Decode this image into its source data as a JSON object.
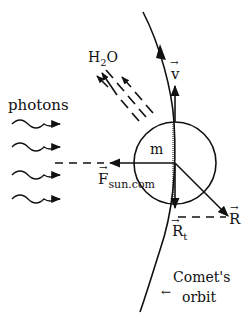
{
  "diagram": {
    "labels": {
      "photons": "photons",
      "water": "H",
      "water_sub": "2",
      "water_tail": "O",
      "velocity": "v",
      "mass": "m",
      "force": "F",
      "force_sub": "sun.com",
      "reaction_total": "R",
      "reaction_tangential": "R",
      "reaction_tangential_sub": "t",
      "orbit_line1": "Comet's",
      "orbit_line2": "orbit",
      "orbit_arrow": "←",
      "vector_mark": "→"
    },
    "colors": {
      "ink": "#111111",
      "background": "#ffffff"
    }
  }
}
